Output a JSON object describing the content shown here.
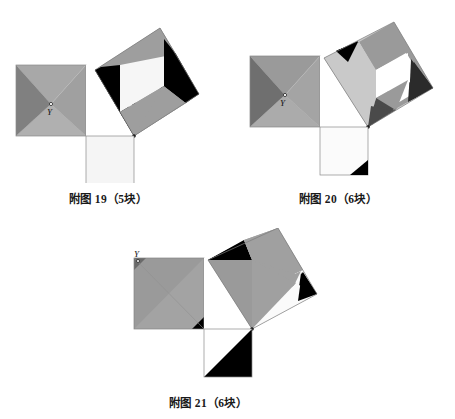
{
  "page": {
    "background": "#ffffff"
  },
  "palette": {
    "black": "#000000",
    "dark_gray": "#3f3f3f",
    "mid_gray": "#808080",
    "gray": "#999999",
    "light_gray": "#b5b5b5",
    "pale_gray": "#d0d0d0",
    "near_white": "#f4f4f4",
    "white": "#ffffff",
    "outline": "#6b6b6b",
    "text": "#1a1a1a"
  },
  "figures": [
    {
      "id": "fig19",
      "caption": "附图 19（5块）",
      "piece_count": 5,
      "vertex_label": "Y",
      "description": "Right triangle with squares on both legs and hypotenuse; left leg square is a four-way pinwheel about point Y, hypotenuse square is dissected into a white center square, two gray bands and two black triangles.",
      "left_square": {
        "pattern": "pinwheel-4",
        "center_label": "Y",
        "fills": [
          "#808080",
          "#a8a8a8",
          "#999999",
          "#b0b0b0"
        ]
      },
      "middle_square": {
        "fill": "#ffffff"
      },
      "bottom_square": {
        "fill": "#f4f4f4"
      },
      "tilted_square": {
        "pieces": [
          "#999999",
          "#f4f4f4",
          "#000000",
          "#000000",
          "#999999"
        ]
      }
    },
    {
      "id": "fig20",
      "caption": "附图 20（6块）",
      "piece_count": 6,
      "vertex_label": "Y",
      "description": "Right triangle with squares on both legs and hypotenuse; left leg square is a four-way pinwheel about point Y, hypotenuse square carries a white square, pale L-shape, gray fields and small dark corner triangles, bottom square has one black corner triangle.",
      "left_square": {
        "pattern": "pinwheel-4",
        "center_label": "Y",
        "fills": [
          "#6f6f6f",
          "#a0a0a0",
          "#9a9a9a",
          "#ababab"
        ]
      },
      "middle_square": {
        "fill": "#ffffff"
      },
      "bottom_square": {
        "fill": "#fbfbfb",
        "corner_triangle": "#000000"
      },
      "tilted_square": {
        "pieces": [
          "#c9c9c9",
          "#9a9a9a",
          "#ffffff",
          "#3f3f3f",
          "#2b2b2b",
          "#000000"
        ]
      }
    },
    {
      "id": "fig21",
      "caption": "附图 21（6块）",
      "piece_count": 6,
      "vertex_label": "Y",
      "description": "Right triangle with squares on both legs and hypotenuse; left leg square has a diagonal band, hypotenuse square carries large gray triangles with black and white corner wedges, bottom square split diagonally white over black.",
      "left_square": {
        "pattern": "diagonal-band",
        "corner_label": "Y",
        "fills": [
          "#9a9a9a",
          "#a5a5a5",
          "#000000"
        ]
      },
      "middle_square": {
        "fill": "#ffffff"
      },
      "bottom_square": {
        "fills": [
          "#ffffff",
          "#000000"
        ]
      },
      "tilted_square": {
        "pieces": [
          "#000000",
          "#9a9a9a",
          "#a0a0a0",
          "#ffffff",
          "#000000",
          "#9a9a9a"
        ]
      }
    }
  ]
}
